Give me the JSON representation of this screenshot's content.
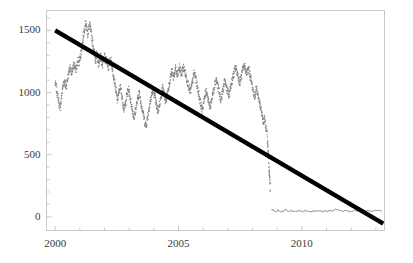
{
  "chart_data": {
    "type": "line",
    "title": "",
    "subtitle": "",
    "xlabel": "",
    "ylabel": "",
    "xlim": [
      1999.65,
      2013.35
    ],
    "ylim": [
      -110,
      1660
    ],
    "grid": false,
    "legend": null,
    "x_ticks_major": [
      2000,
      2005,
      2010
    ],
    "x_tick_labels": [
      "2000",
      "2005",
      "2010"
    ],
    "x_ticks_minor": [
      2001,
      2002,
      2003,
      2004,
      2006,
      2007,
      2008,
      2009,
      2011,
      2012,
      2013
    ],
    "y_ticks_major": [
      0,
      500,
      1000,
      1500
    ],
    "y_tick_labels": [
      "0",
      "500",
      "1000",
      "1500"
    ],
    "y_ticks_minor": [
      100,
      200,
      300,
      400,
      600,
      700,
      800,
      900,
      1100,
      1200,
      1300,
      1400,
      1600
    ],
    "colors": {
      "series_noisy": "#808080",
      "series_flat": "#8a8a8a",
      "trend_line": "#000000",
      "axis": "#c8c8c8",
      "tick_text": "#3a3a3a",
      "background": "#ffffff"
    },
    "series": [
      {
        "name": "noisy-price-series",
        "style": "dotted-line",
        "color": "#808080",
        "x": [
          2000.0,
          2000.04,
          2000.08,
          2000.12,
          2000.16,
          2000.2,
          2000.24,
          2000.28,
          2000.32,
          2000.36,
          2000.4,
          2000.44,
          2000.48,
          2000.52,
          2000.56,
          2000.6,
          2000.64,
          2000.68,
          2000.72,
          2000.76,
          2000.8,
          2000.84,
          2000.88,
          2000.92,
          2000.96,
          2001.0,
          2001.04,
          2001.08,
          2001.12,
          2001.16,
          2001.2,
          2001.24,
          2001.28,
          2001.32,
          2001.36,
          2001.4,
          2001.44,
          2001.48,
          2001.52,
          2001.56,
          2001.6,
          2001.64,
          2001.68,
          2001.72,
          2001.76,
          2001.8,
          2001.84,
          2001.88,
          2001.92,
          2001.96,
          2002.0,
          2002.04,
          2002.08,
          2002.12,
          2002.16,
          2002.2,
          2002.24,
          2002.28,
          2002.32,
          2002.36,
          2002.4,
          2002.44,
          2002.48,
          2002.52,
          2002.56,
          2002.6,
          2002.64,
          2002.68,
          2002.72,
          2002.76,
          2002.8,
          2002.84,
          2002.88,
          2002.92,
          2002.96,
          2003.0,
          2003.04,
          2003.08,
          2003.12,
          2003.16,
          2003.2,
          2003.24,
          2003.28,
          2003.32,
          2003.36,
          2003.4,
          2003.44,
          2003.48,
          2003.52,
          2003.56,
          2003.6,
          2003.64,
          2003.68,
          2003.72,
          2003.76,
          2003.8,
          2003.84,
          2003.88,
          2003.92,
          2003.96,
          2004.0,
          2004.04,
          2004.08,
          2004.12,
          2004.16,
          2004.2,
          2004.24,
          2004.28,
          2004.32,
          2004.36,
          2004.4,
          2004.44,
          2004.48,
          2004.52,
          2004.56,
          2004.6,
          2004.64,
          2004.68,
          2004.72,
          2004.76,
          2004.8,
          2004.84,
          2004.88,
          2004.92,
          2004.96,
          2005.0,
          2005.04,
          2005.08,
          2005.12,
          2005.16,
          2005.2,
          2005.24,
          2005.28,
          2005.32,
          2005.36,
          2005.4,
          2005.44,
          2005.48,
          2005.52,
          2005.56,
          2005.6,
          2005.64,
          2005.68,
          2005.72,
          2005.76,
          2005.8,
          2005.84,
          2005.88,
          2005.92,
          2005.96,
          2006.0,
          2006.04,
          2006.08,
          2006.12,
          2006.16,
          2006.2,
          2006.24,
          2006.28,
          2006.32,
          2006.36,
          2006.4,
          2006.44,
          2006.48,
          2006.52,
          2006.56,
          2006.6,
          2006.64,
          2006.68,
          2006.72,
          2006.76,
          2006.8,
          2006.84,
          2006.88,
          2006.92,
          2006.96,
          2007.0,
          2007.04,
          2007.08,
          2007.12,
          2007.16,
          2007.2,
          2007.24,
          2007.28,
          2007.32,
          2007.36,
          2007.4,
          2007.44,
          2007.48,
          2007.52,
          2007.56,
          2007.6,
          2007.64,
          2007.68,
          2007.72,
          2007.76,
          2007.8,
          2007.84,
          2007.88,
          2007.92,
          2007.96,
          2008.0,
          2008.04,
          2008.08,
          2008.12,
          2008.16,
          2008.2,
          2008.24,
          2008.28,
          2008.32,
          2008.36,
          2008.4,
          2008.44,
          2008.48,
          2008.52,
          2008.56,
          2008.6,
          2008.62,
          2008.64,
          2008.66,
          2008.68,
          2008.7,
          2008.72
        ],
        "y": [
          1075,
          1045,
          1000,
          960,
          905,
          880,
          930,
          1000,
          1060,
          1095,
          1070,
          1040,
          1085,
          1130,
          1175,
          1200,
          1170,
          1145,
          1190,
          1230,
          1210,
          1180,
          1215,
          1255,
          1235,
          1270,
          1310,
          1355,
          1420,
          1480,
          1530,
          1560,
          1520,
          1470,
          1510,
          1550,
          1500,
          1450,
          1400,
          1355,
          1300,
          1260,
          1310,
          1270,
          1225,
          1260,
          1290,
          1250,
          1215,
          1250,
          1285,
          1250,
          1270,
          1240,
          1200,
          1235,
          1270,
          1240,
          1190,
          1150,
          1100,
          1050,
          990,
          940,
          975,
          1010,
          1050,
          1000,
          950,
          900,
          860,
          900,
          950,
          990,
          1030,
          1000,
          960,
          915,
          870,
          830,
          800,
          840,
          880,
          920,
          960,
          1000,
          960,
          920,
          880,
          840,
          800,
          760,
          730,
          770,
          820,
          870,
          910,
          950,
          990,
          1020,
          1000,
          960,
          920,
          880,
          850,
          880,
          920,
          960,
          1000,
          1040,
          1000,
          960,
          920,
          960,
          1000,
          1045,
          1090,
          1130,
          1170,
          1150,
          1120,
          1160,
          1190,
          1160,
          1130,
          1170,
          1200,
          1175,
          1145,
          1175,
          1205,
          1180,
          1150,
          1120,
          1090,
          1060,
          1030,
          1000,
          1040,
          1080,
          1120,
          1160,
          1130,
          1090,
          1050,
          1010,
          970,
          930,
          890,
          860,
          900,
          940,
          980,
          1020,
          990,
          950,
          910,
          880,
          920,
          960,
          1000,
          1040,
          1080,
          1110,
          1080,
          1050,
          1010,
          970,
          940,
          980,
          1020,
          1060,
          1090,
          1060,
          1030,
          1000,
          970,
          1010,
          1050,
          1090,
          1120,
          1150,
          1180,
          1200,
          1175,
          1145,
          1110,
          1075,
          1105,
          1140,
          1175,
          1200,
          1215,
          1185,
          1150,
          1170,
          1195,
          1160,
          1120,
          1080,
          1040,
          1000,
          960,
          1000,
          1040,
          1000,
          960,
          920,
          880,
          840,
          800,
          760,
          790,
          750,
          700,
          640,
          560,
          500,
          430,
          360,
          300,
          215
        ]
      },
      {
        "name": "post-crash-flat-series",
        "style": "solid-line",
        "color": "#8a8a8a",
        "x": [
          2008.76,
          2008.82,
          2008.88,
          2008.95,
          2009.05,
          2009.15,
          2009.25,
          2009.35,
          2009.45,
          2009.55,
          2009.65,
          2009.75,
          2009.85,
          2009.95,
          2010.05,
          2010.15,
          2010.25,
          2010.35,
          2010.45,
          2010.55,
          2010.65,
          2010.75,
          2010.85,
          2010.95,
          2011.05,
          2011.15,
          2011.25,
          2011.35,
          2011.45,
          2011.55,
          2011.65,
          2011.75,
          2011.85,
          2011.95,
          2012.05,
          2012.15,
          2012.25,
          2012.35,
          2012.45,
          2012.55,
          2012.65,
          2012.75,
          2012.85,
          2012.95,
          2013.05,
          2013.15,
          2013.25
        ],
        "y": [
          55,
          60,
          48,
          42,
          55,
          38,
          45,
          58,
          40,
          50,
          44,
          38,
          50,
          46,
          42,
          52,
          45,
          40,
          48,
          44,
          50,
          46,
          42,
          48,
          44,
          50,
          46,
          62,
          58,
          48,
          44,
          50,
          46,
          42,
          48,
          52,
          46,
          42,
          50,
          46,
          52,
          48,
          44,
          50,
          52,
          48,
          50
        ]
      }
    ],
    "trend_line": {
      "name": "linear-trend",
      "color": "#000000",
      "x_start": 2000.0,
      "y_start": 1500,
      "x_end": 2013.3,
      "y_end": -55,
      "width_px": 4.5
    }
  }
}
